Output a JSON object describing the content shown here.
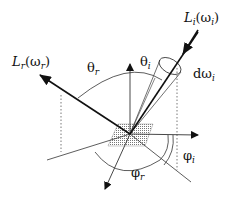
{
  "diagram": {
    "labels": {
      "incident_radiance": "L",
      "incident_radiance_sub": "i",
      "incident_radiance_arg": "(ω",
      "incident_radiance_arg_sub": "i",
      "incident_radiance_close": ")",
      "reflected_radiance": "L",
      "reflected_radiance_sub": "r",
      "reflected_radiance_arg": "(ω",
      "reflected_radiance_arg_sub": "r",
      "reflected_radiance_close": ")",
      "theta_r": "θ",
      "theta_r_sub": "r",
      "theta_i": "θ",
      "theta_i_sub": "i",
      "solid_angle": "dω",
      "solid_angle_sub": "i",
      "phi_i": "φ",
      "phi_i_sub": "i",
      "phi_r": "φ",
      "phi_r_sub": "r"
    },
    "colors": {
      "line": "#111111",
      "thin_line": "#333333",
      "dotted": "#555555",
      "hatch": "#888888"
    }
  }
}
